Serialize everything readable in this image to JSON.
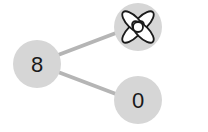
{
  "colors": {
    "node_fill": "#d6d6d6",
    "edge": "#b5b5b5",
    "text": "#1a1a1a",
    "icon_stroke": "#1a1a1a",
    "icon_fill": "#ffffff"
  },
  "nodes": [
    {
      "id": "left",
      "label": "8",
      "cx": 37,
      "cy": 64,
      "r": 24
    },
    {
      "id": "top-right",
      "label": "",
      "icon": "flower-icon",
      "cx": 138,
      "cy": 27,
      "r": 24
    },
    {
      "id": "bottom-right",
      "label": "0",
      "cx": 138,
      "cy": 100,
      "r": 24
    }
  ],
  "edges": [
    {
      "from": "left",
      "to": "top-right"
    },
    {
      "from": "left",
      "to": "bottom-right"
    }
  ]
}
